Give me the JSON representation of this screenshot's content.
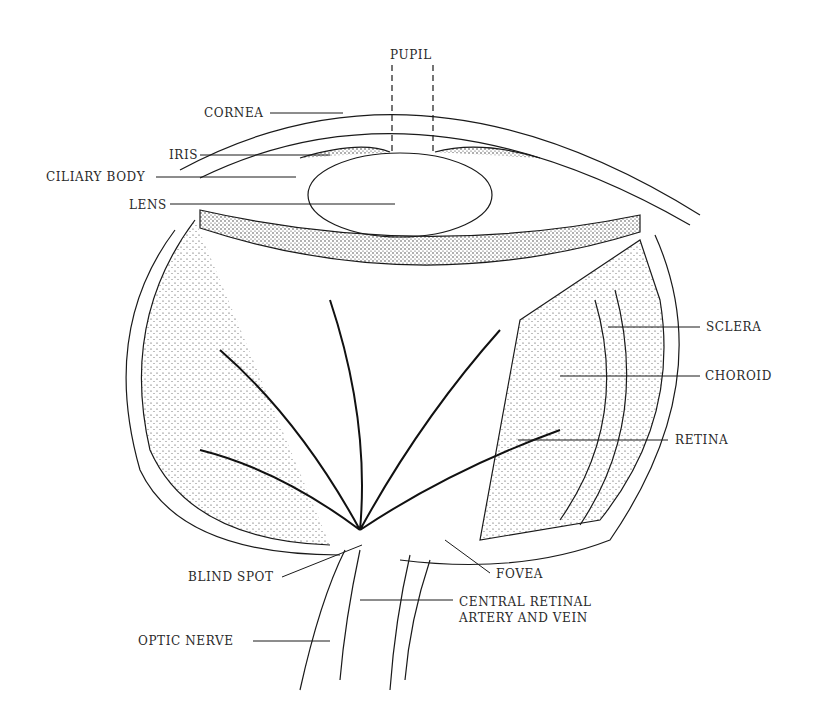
{
  "diagram": {
    "type": "anatomical-illustration",
    "colors": {
      "ink": "#1a1a1a",
      "paper": "#ffffff",
      "label": "#2a2a2a"
    },
    "labels": [
      {
        "id": "pupil",
        "text": "PUPIL",
        "x": 390,
        "y": 48
      },
      {
        "id": "cornea",
        "text": "CORNEA",
        "x": 204,
        "y": 106
      },
      {
        "id": "iris",
        "text": "IRIS",
        "x": 169,
        "y": 148
      },
      {
        "id": "ciliary-body",
        "text": "CILIARY BODY",
        "x": 46,
        "y": 170
      },
      {
        "id": "lens",
        "text": "LENS",
        "x": 129,
        "y": 198
      },
      {
        "id": "sclera",
        "text": "SCLERA",
        "x": 706,
        "y": 320
      },
      {
        "id": "choroid",
        "text": "CHOROID",
        "x": 705,
        "y": 369
      },
      {
        "id": "retina",
        "text": "RETINA",
        "x": 675,
        "y": 433
      },
      {
        "id": "blind-spot",
        "text": "BLIND SPOT",
        "x": 188,
        "y": 570
      },
      {
        "id": "fovea",
        "text": "FOVEA",
        "x": 496,
        "y": 567
      },
      {
        "id": "central-retinal-1",
        "text": "CENTRAL RETINAL",
        "x": 459,
        "y": 595
      },
      {
        "id": "central-retinal-2",
        "text": "ARTERY AND VEIN",
        "x": 459,
        "y": 611
      },
      {
        "id": "optic-nerve",
        "text": "OPTIC NERVE",
        "x": 138,
        "y": 634
      }
    ]
  }
}
